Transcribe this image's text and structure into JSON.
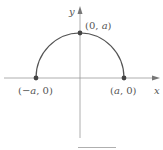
{
  "diagram": {
    "type": "semicircle-on-axes",
    "axes": {
      "x_label": "x",
      "y_label": "y"
    },
    "points": [
      {
        "id": "left",
        "label_pre": "(−",
        "label_var": "a",
        "label_post": ", 0)"
      },
      {
        "id": "right",
        "label_pre": "(",
        "label_var": "a",
        "label_post": ", 0)"
      },
      {
        "id": "top",
        "label_pre": "(0, ",
        "label_var": "a",
        "label_post": ")"
      }
    ],
    "colors": {
      "axis": "#9a9a9a",
      "curve": "#555555",
      "point": "#444444",
      "text": "#555555"
    }
  }
}
